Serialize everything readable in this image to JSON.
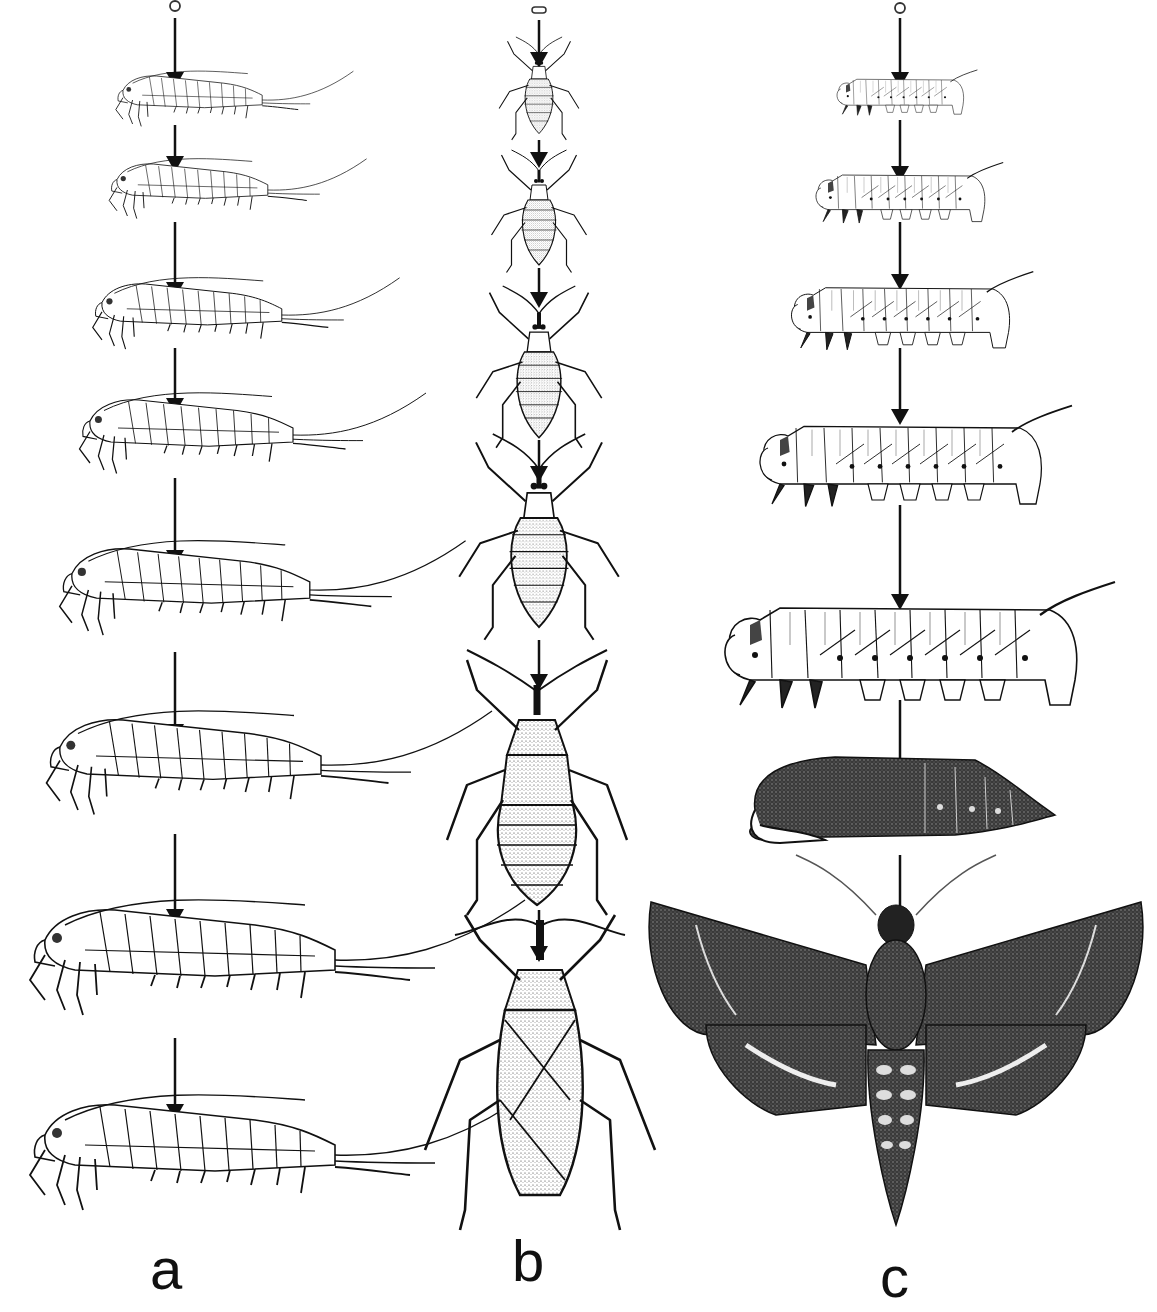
{
  "figure": {
    "background": "#ffffff",
    "ink": "#111111",
    "panels": [
      {
        "id": "a",
        "label": "a",
        "center_x": 175,
        "label_pos": {
          "x": 150,
          "y": 1240
        },
        "stages": [
          {
            "type": "egg",
            "y": 6
          },
          {
            "type": "silverfish",
            "y": 100,
            "scale": 0.48
          },
          {
            "type": "silverfish",
            "y": 190,
            "scale": 0.52
          },
          {
            "type": "silverfish",
            "y": 315,
            "scale": 0.62
          },
          {
            "type": "silverfish",
            "y": 435,
            "scale": 0.7
          },
          {
            "type": "silverfish",
            "y": 590,
            "scale": 0.82
          },
          {
            "type": "silverfish",
            "y": 765,
            "scale": 0.9
          },
          {
            "type": "silverfish",
            "y": 960,
            "scale": 1.0
          },
          {
            "type": "silverfish",
            "y": 1155,
            "scale": 1.0
          }
        ],
        "arrows": [
          {
            "y1": 18,
            "y2": 88
          },
          {
            "y1": 125,
            "y2": 172
          },
          {
            "y1": 222,
            "y2": 298
          },
          {
            "y1": 348,
            "y2": 414
          },
          {
            "y1": 478,
            "y2": 566
          },
          {
            "y1": 652,
            "y2": 740
          },
          {
            "y1": 834,
            "y2": 925
          },
          {
            "y1": 1038,
            "y2": 1120
          }
        ]
      },
      {
        "id": "b",
        "label": "b",
        "center_x": 539,
        "label_pos": {
          "x": 512,
          "y": 1232
        },
        "stages": [
          {
            "type": "egg-oval",
            "y": 10
          },
          {
            "type": "nymph",
            "y": 100,
            "scale": 0.42
          },
          {
            "type": "nymph",
            "y": 225,
            "scale": 0.5
          },
          {
            "type": "nymph",
            "y": 385,
            "scale": 0.66
          },
          {
            "type": "nymph",
            "y": 560,
            "scale": 0.84
          },
          {
            "type": "nymph-winged",
            "y": 800,
            "scale": 0.92
          },
          {
            "type": "adult-bug",
            "y": 1080,
            "scale": 1.0
          }
        ],
        "arrows": [
          {
            "y1": 20,
            "y2": 68
          },
          {
            "y1": 140,
            "y2": 168
          },
          {
            "y1": 268,
            "y2": 308
          },
          {
            "y1": 440,
            "y2": 482
          },
          {
            "y1": 640,
            "y2": 690
          },
          {
            "y1": 910,
            "y2": 962
          }
        ]
      },
      {
        "id": "c",
        "label": "c",
        "center_x": 900,
        "label_pos": {
          "x": 880,
          "y": 1248
        },
        "stages": [
          {
            "type": "egg",
            "y": 8
          },
          {
            "type": "caterpillar",
            "y": 98,
            "scale": 0.36
          },
          {
            "type": "caterpillar",
            "y": 200,
            "scale": 0.48
          },
          {
            "type": "caterpillar",
            "y": 320,
            "scale": 0.62
          },
          {
            "type": "caterpillar",
            "y": 468,
            "scale": 0.8
          },
          {
            "type": "caterpillar",
            "y": 660,
            "scale": 1.0
          },
          {
            "type": "pupa",
            "y": 815
          },
          {
            "type": "moth",
            "y": 1085
          }
        ],
        "arrows": [
          {
            "y1": 18,
            "y2": 88
          },
          {
            "y1": 120,
            "y2": 182
          },
          {
            "y1": 222,
            "y2": 290
          },
          {
            "y1": 348,
            "y2": 425
          },
          {
            "y1": 505,
            "y2": 610
          },
          {
            "y1": 700,
            "y2": 778
          },
          {
            "y1": 855,
            "y2": 975
          }
        ]
      }
    ]
  }
}
